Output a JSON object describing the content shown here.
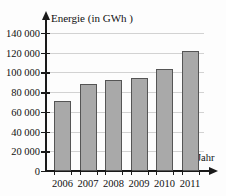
{
  "chart_data": {
    "type": "bar",
    "title": "",
    "xlabel": "Jahr",
    "ylabel": "Energie (in GWh )",
    "categories": [
      "2006",
      "2007",
      "2008",
      "2009",
      "2010",
      "2011"
    ],
    "values": [
      71000,
      88000,
      92500,
      94000,
      104000,
      121500
    ],
    "ylim": [
      0,
      145000
    ],
    "ytick_values": [
      0,
      20000,
      40000,
      60000,
      80000,
      100000,
      120000,
      140000
    ],
    "ytick_labels": [
      "0",
      "20 000",
      "40 000",
      "60 000",
      "80 000",
      "100 000",
      "120 000",
      "140 000"
    ],
    "grid": true,
    "legend": false,
    "series": [
      {
        "name": "Energie",
        "values": [
          71000,
          88000,
          92500,
          94000,
          104000,
          121500
        ]
      }
    ],
    "colors": {
      "bar_fill": "#a9a9a9",
      "bar_border": "#555555",
      "axis": "#1a1a1a",
      "grid": "#d2d2d2",
      "text": "#111111",
      "background": "#fdfdfd"
    }
  }
}
